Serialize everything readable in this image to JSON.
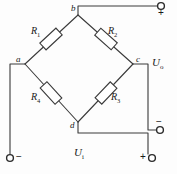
{
  "diagram": {
    "line_color": "#3a3a3a",
    "text_color": "#1a1a1a",
    "background": "#fdfdfd",
    "nodes": [
      {
        "id": "a",
        "label": "a",
        "x": 25,
        "y": 64
      },
      {
        "id": "b",
        "label": "b",
        "x": 78,
        "y": 15
      },
      {
        "id": "c",
        "label": "c",
        "x": 133,
        "y": 64
      },
      {
        "id": "d",
        "label": "d",
        "x": 78,
        "y": 122
      }
    ],
    "resistors": [
      {
        "id": "R1",
        "label": "R",
        "sub": "1",
        "branch": "a-b",
        "cx": 51,
        "cy": 39
      },
      {
        "id": "R2",
        "label": "R",
        "sub": "2",
        "branch": "b-c",
        "cx": 106,
        "cy": 39
      },
      {
        "id": "R3",
        "label": "R",
        "sub": "3",
        "branch": "c-d",
        "cx": 106,
        "cy": 93
      },
      {
        "id": "R4",
        "label": "R",
        "sub": "4",
        "branch": "a-d",
        "cx": 51,
        "cy": 93
      }
    ],
    "resistor_labels": [
      {
        "for": "R1",
        "text": "R",
        "sub": "1",
        "x": 33,
        "y": 29
      },
      {
        "for": "R2",
        "text": "R",
        "sub": "2",
        "x": 110,
        "y": 29
      },
      {
        "for": "R3",
        "text": "R",
        "sub": "3",
        "x": 112,
        "y": 95
      },
      {
        "for": "R4",
        "text": "R",
        "sub": "4",
        "x": 33,
        "y": 95
      }
    ],
    "voltages": [
      {
        "id": "Uo",
        "text": "U",
        "sub": "o",
        "x": 152,
        "y": 62,
        "meaning": "output-voltage"
      },
      {
        "id": "Ui",
        "text": "U",
        "sub": "i",
        "x": 78,
        "y": 152,
        "meaning": "input-voltage"
      }
    ],
    "terminals": [
      {
        "id": "out-plus",
        "polarity": "+",
        "x": 162,
        "y": 6,
        "sign_x": 158,
        "sign_y": 11,
        "sign_pos": "below"
      },
      {
        "id": "out-minus",
        "polarity": "−",
        "x": 161,
        "y": 130,
        "sign_x": 157,
        "sign_y": 118,
        "sign_pos": "above"
      },
      {
        "id": "in-minus",
        "polarity": "−",
        "x": 10,
        "y": 158,
        "sign_x": 16,
        "sign_y": 152,
        "sign_pos": "right"
      },
      {
        "id": "in-plus",
        "polarity": "+",
        "x": 152,
        "y": 158,
        "sign_x": 140,
        "sign_y": 152,
        "sign_pos": "left"
      }
    ],
    "wires": [
      {
        "id": "b-to-out-plus",
        "path": "M78,15 L78,6 L157,6"
      },
      {
        "id": "c-to-out-minus",
        "path": "M133,64 L148,64 L148,130 L156,130"
      },
      {
        "id": "a-to-in-minus",
        "path": "M25,64 L10,64 L10,154"
      },
      {
        "id": "d-to-in-plus",
        "path": "M78,122 L78,133 L148,133 L148,154"
      }
    ]
  }
}
